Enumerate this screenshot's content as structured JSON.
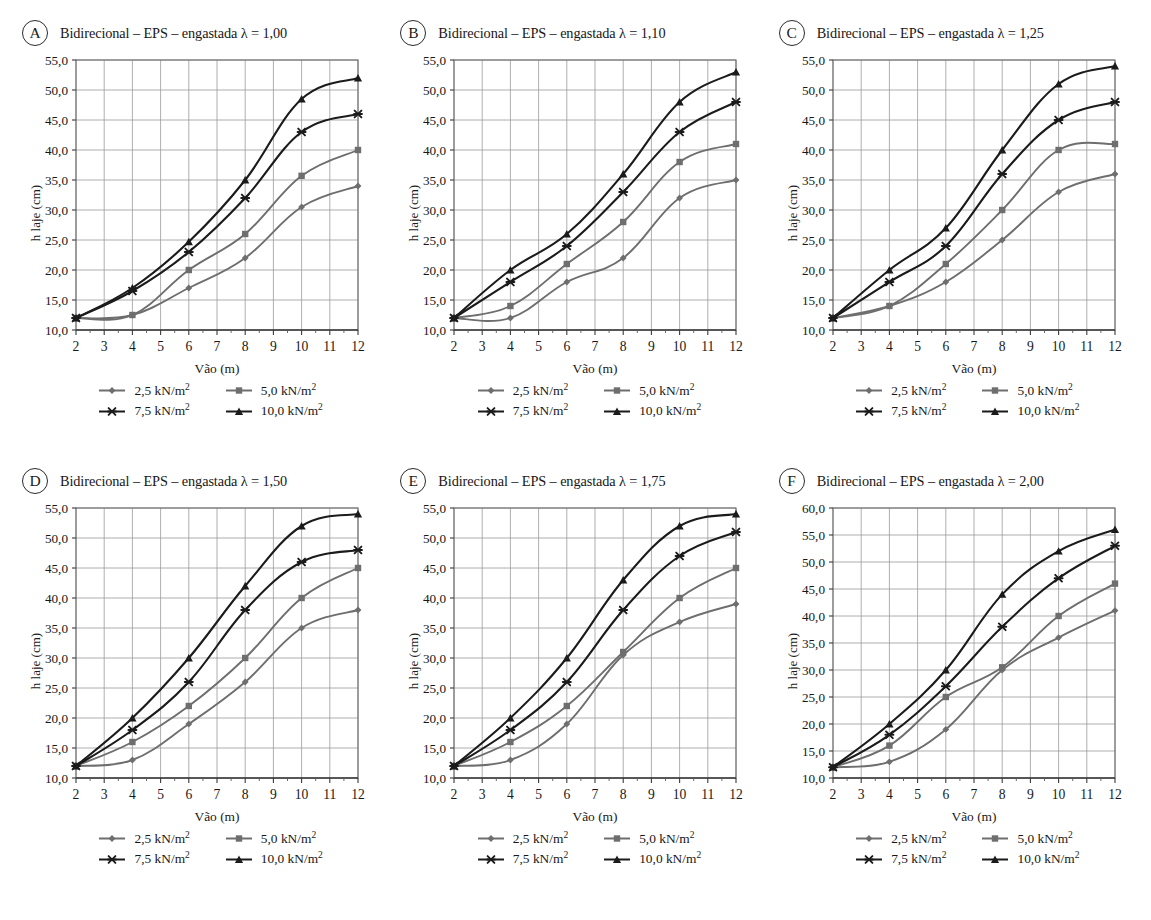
{
  "figure": {
    "panel_count": 6,
    "legend_labels": [
      "2,5 kN/m²",
      "5,0 kN/m²",
      "7,5 kN/m²",
      "10,0 kN/m²"
    ],
    "series_colors": [
      "#6e6e6e",
      "#6e6e6e",
      "#1b1b1b",
      "#1b1b1b"
    ],
    "series_markers": [
      "diamond",
      "square",
      "star",
      "triangle"
    ],
    "xlabel": "Vão (m)",
    "ylabel": "h laje (cm)"
  },
  "panels": [
    {
      "badge": "A",
      "title": "Bidirecional – EPS – engastada λ = 1,00",
      "lambda": "1,00",
      "chart_data": {
        "type": "line",
        "title": "Bidirecional – EPS – engastada λ = 1,00",
        "xlabel": "Vão (m)",
        "ylabel": "h laje (cm)",
        "x": [
          2,
          4,
          6,
          8,
          10,
          12
        ],
        "xlim": [
          2,
          12
        ],
        "ylim": [
          10.0,
          55.0
        ],
        "ytick_labels": [
          "10,0",
          "15,0",
          "20,0",
          "25,0",
          "30,0",
          "35,0",
          "40,0",
          "45,0",
          "50,0",
          "55,0"
        ],
        "xtick_labels": [
          "2",
          "3",
          "4",
          "5",
          "6",
          "7",
          "8",
          "9",
          "10",
          "11",
          "12"
        ],
        "grid": true,
        "legend_position": "below",
        "series": [
          {
            "name": "2,5 kN/m²",
            "values": [
              12.0,
              12.5,
              17.0,
              22.0,
              30.5,
              34.0
            ]
          },
          {
            "name": "5,0 kN/m²",
            "values": [
              12.0,
              12.5,
              20.0,
              26.0,
              35.7,
              40.0
            ]
          },
          {
            "name": "7,5 kN/m²",
            "values": [
              12.0,
              16.5,
              23.0,
              32.0,
              43.0,
              46.0
            ]
          },
          {
            "name": "10,0 kN/m²",
            "values": [
              12.0,
              17.0,
              24.7,
              35.0,
              48.5,
              52.0
            ]
          }
        ]
      }
    },
    {
      "badge": "B",
      "title": "Bidirecional – EPS – engastada λ = 1,10",
      "lambda": "1,10",
      "chart_data": {
        "type": "line",
        "title": "Bidirecional – EPS – engastada λ = 1,10",
        "xlabel": "Vão (m)",
        "ylabel": "h laje (cm)",
        "x": [
          2,
          4,
          6,
          8,
          10,
          12
        ],
        "xlim": [
          2,
          12
        ],
        "ylim": [
          10.0,
          55.0
        ],
        "ytick_labels": [
          "10,0",
          "15,0",
          "20,0",
          "25,0",
          "30,0",
          "35,0",
          "40,0",
          "45,0",
          "50,0",
          "55,0"
        ],
        "xtick_labels": [
          "2",
          "3",
          "4",
          "5",
          "6",
          "7",
          "8",
          "9",
          "10",
          "11",
          "12"
        ],
        "grid": true,
        "legend_position": "below",
        "series": [
          {
            "name": "2,5 kN/m²",
            "values": [
              12.0,
              12.0,
              18.0,
              22.0,
              32.0,
              35.0
            ]
          },
          {
            "name": "5,0 kN/m²",
            "values": [
              12.0,
              14.0,
              21.0,
              28.0,
              38.0,
              41.0
            ]
          },
          {
            "name": "7,5 kN/m²",
            "values": [
              12.0,
              18.0,
              24.0,
              33.0,
              43.0,
              48.0
            ]
          },
          {
            "name": "10,0 kN/m²",
            "values": [
              12.0,
              20.0,
              26.0,
              36.0,
              48.0,
              53.0
            ]
          }
        ]
      }
    },
    {
      "badge": "C",
      "title": "Bidirecional – EPS – engastada λ = 1,25",
      "lambda": "1,25",
      "chart_data": {
        "type": "line",
        "title": "Bidirecional – EPS – engastada λ = 1,25",
        "xlabel": "Vão (m)",
        "ylabel": "h laje (cm)",
        "x": [
          2,
          4,
          6,
          8,
          10,
          12
        ],
        "xlim": [
          2,
          12
        ],
        "ylim": [
          10.0,
          55.0
        ],
        "ytick_labels": [
          "10,0",
          "15,0",
          "20,0",
          "25,0",
          "30,0",
          "35,0",
          "40,0",
          "45,0",
          "50,0",
          "55,0"
        ],
        "xtick_labels": [
          "2",
          "3",
          "4",
          "5",
          "6",
          "7",
          "8",
          "9",
          "10",
          "11",
          "12"
        ],
        "grid": true,
        "legend_position": "below",
        "series": [
          {
            "name": "2,5 kN/m²",
            "values": [
              12.0,
              14.0,
              18.0,
              25.0,
              33.0,
              36.0
            ]
          },
          {
            "name": "5,0 kN/m²",
            "values": [
              12.0,
              14.0,
              21.0,
              30.0,
              40.0,
              41.0
            ]
          },
          {
            "name": "7,5 kN/m²",
            "values": [
              12.0,
              18.0,
              24.0,
              36.0,
              45.0,
              48.0
            ]
          },
          {
            "name": "10,0 kN/m²",
            "values": [
              12.0,
              20.0,
              27.0,
              40.0,
              51.0,
              54.0
            ]
          }
        ]
      }
    },
    {
      "badge": "D",
      "title": "Bidirecional – EPS – engastada λ = 1,50",
      "lambda": "1,50",
      "chart_data": {
        "type": "line",
        "title": "Bidirecional – EPS – engastada λ = 1,50",
        "xlabel": "Vão (m)",
        "ylabel": "h laje (cm)",
        "x": [
          2,
          4,
          6,
          8,
          10,
          12
        ],
        "xlim": [
          2,
          12
        ],
        "ylim": [
          10.0,
          55.0
        ],
        "ytick_labels": [
          "10,0",
          "15,0",
          "20,0",
          "25,0",
          "30,0",
          "35,0",
          "40,0",
          "45,0",
          "50,0",
          "55,0"
        ],
        "xtick_labels": [
          "2",
          "3",
          "4",
          "5",
          "6",
          "7",
          "8",
          "9",
          "10",
          "11",
          "12"
        ],
        "grid": true,
        "legend_position": "below",
        "series": [
          {
            "name": "2,5 kN/m²",
            "values": [
              12.0,
              13.0,
              19.0,
              26.0,
              35.0,
              38.0
            ]
          },
          {
            "name": "5,0 kN/m²",
            "values": [
              12.0,
              16.0,
              22.0,
              30.0,
              40.0,
              45.0
            ]
          },
          {
            "name": "7,5 kN/m²",
            "values": [
              12.0,
              18.0,
              26.0,
              38.0,
              46.0,
              48.0
            ]
          },
          {
            "name": "10,0 kN/m²",
            "values": [
              12.0,
              20.0,
              30.0,
              42.0,
              52.0,
              54.0
            ]
          }
        ]
      }
    },
    {
      "badge": "E",
      "title": "Bidirecional – EPS – engastada λ = 1,75",
      "lambda": "1,75",
      "chart_data": {
        "type": "line",
        "title": "Bidirecional – EPS – engastada λ = 1,75",
        "xlabel": "Vão (m)",
        "ylabel": "h laje (cm)",
        "x": [
          2,
          4,
          6,
          8,
          10,
          12
        ],
        "xlim": [
          2,
          12
        ],
        "ylim": [
          10.0,
          55.0
        ],
        "ytick_labels": [
          "10,0",
          "15,0",
          "20,0",
          "25,0",
          "30,0",
          "35,0",
          "40,0",
          "45,0",
          "50,0",
          "55,0"
        ],
        "xtick_labels": [
          "2",
          "3",
          "4",
          "5",
          "6",
          "7",
          "8",
          "9",
          "10",
          "11",
          "12"
        ],
        "grid": true,
        "legend_position": "below",
        "series": [
          {
            "name": "2,5 kN/m²",
            "values": [
              12.0,
              13.0,
              19.0,
              30.5,
              36.0,
              39.0
            ]
          },
          {
            "name": "5,0 kN/m²",
            "values": [
              12.0,
              16.0,
              22.0,
              31.0,
              40.0,
              45.0
            ]
          },
          {
            "name": "7,5 kN/m²",
            "values": [
              12.0,
              18.0,
              26.0,
              38.0,
              47.0,
              51.0
            ]
          },
          {
            "name": "10,0 kN/m²",
            "values": [
              12.0,
              20.0,
              30.0,
              43.0,
              52.0,
              54.0
            ]
          }
        ]
      }
    },
    {
      "badge": "F",
      "title": "Bidirecional – EPS – engastada λ = 2,00",
      "lambda": "2,00",
      "chart_data": {
        "type": "line",
        "title": "Bidirecional – EPS – engastada λ = 2,00",
        "xlabel": "Vão (m)",
        "ylabel": "h laje (cm)",
        "x": [
          2,
          4,
          6,
          8,
          10,
          12
        ],
        "xlim": [
          2,
          12
        ],
        "ylim": [
          10.0,
          60.0
        ],
        "ytick_labels": [
          "10,0",
          "15,0",
          "20,0",
          "25,0",
          "30,0",
          "35,0",
          "40,0",
          "45,0",
          "50,0",
          "55,0",
          "60,0"
        ],
        "xtick_labels": [
          "2",
          "3",
          "4",
          "5",
          "6",
          "7",
          "8",
          "9",
          "10",
          "11",
          "12"
        ],
        "grid": true,
        "legend_position": "below",
        "series": [
          {
            "name": "2,5 kN/m²",
            "values": [
              12.0,
              13.0,
              19.0,
              30.0,
              36.0,
              41.0
            ]
          },
          {
            "name": "5,0 kN/m²",
            "values": [
              12.0,
              16.0,
              25.0,
              30.5,
              40.0,
              46.0
            ]
          },
          {
            "name": "7,5 kN/m²",
            "values": [
              12.0,
              18.0,
              27.0,
              38.0,
              47.0,
              53.0
            ]
          },
          {
            "name": "10,0 kN/m²",
            "values": [
              12.0,
              20.0,
              30.0,
              44.0,
              52.0,
              56.0
            ]
          }
        ]
      }
    }
  ]
}
